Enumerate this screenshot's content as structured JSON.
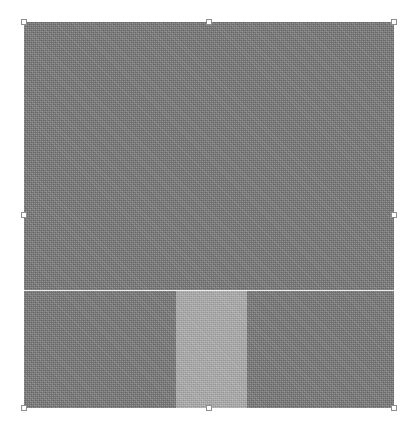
{
  "canvas": {
    "width": 416,
    "height": 432,
    "background_color": "#ffffff",
    "label": "Design canvas"
  },
  "selection": {
    "label": "Selected object",
    "object_name": "Textured panel",
    "x": 24,
    "y": 22,
    "width": 370,
    "height": 386,
    "fill_color": "#7b7b7b",
    "handle_fill_color": "#fdfdfd",
    "handle_border_color": "#8e8e8e",
    "handles": [
      {
        "id": "nw",
        "label": "Top-left resize handle"
      },
      {
        "id": "n",
        "label": "Top-center resize handle"
      },
      {
        "id": "ne",
        "label": "Top-right resize handle"
      },
      {
        "id": "w",
        "label": "Middle-left resize handle"
      },
      {
        "id": "e",
        "label": "Middle-right resize handle"
      },
      {
        "id": "sw",
        "label": "Bottom-left resize handle"
      },
      {
        "id": "s",
        "label": "Bottom-center resize handle"
      },
      {
        "id": "se",
        "label": "Bottom-right resize handle"
      }
    ]
  },
  "object": {
    "upper_band": {
      "label": "Upper textured region",
      "height": 268,
      "fill_color": "#7b7b7b"
    },
    "divider": {
      "label": "Horizontal divider line",
      "y": 268,
      "color": "#ebebeb",
      "thickness": 1
    },
    "lower_band": {
      "label": "Lower textured region",
      "height": 117,
      "fill_color": "#7b7b7b"
    },
    "inner_block": {
      "label": "Nested light panel",
      "x": 152,
      "y": 269,
      "width": 71,
      "height": 117,
      "fill_color": "#ababab"
    }
  }
}
